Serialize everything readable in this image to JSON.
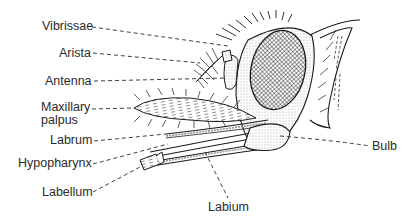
{
  "diagram": {
    "colors": {
      "ink": "#1a1a1a",
      "label": "#2a2a2a",
      "background": "#ffffff"
    },
    "labels": {
      "vibrissae": "Vibrissae",
      "arista": "Arista",
      "antenna": "Antenna",
      "maxillary_palpus_line1": "Maxillary",
      "maxillary_palpus_line2": "palpus",
      "labrum": "Labrum",
      "hypopharynx": "Hypopharynx",
      "labellum": "Labellum",
      "labium": "Labium",
      "bulb": "Bulb"
    }
  }
}
